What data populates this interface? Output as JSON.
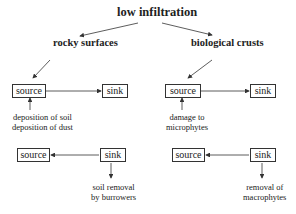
{
  "diagram": {
    "title": "low infiltration",
    "branches": [
      {
        "heading": "rocky surfaces",
        "top_flow": {
          "source": "source",
          "sink": "sink",
          "note_lines": [
            "deposition of soil",
            "deposition of dust"
          ]
        },
        "bottom_flow": {
          "source": "source",
          "sink": "sink",
          "note_lines": [
            "soil removal",
            "by burrowers"
          ]
        }
      },
      {
        "heading": "biological crusts",
        "top_flow": {
          "source": "source",
          "sink": "sink",
          "note_lines": [
            "damage to",
            "microphytes"
          ]
        },
        "bottom_flow": {
          "source": "source",
          "sink": "sink",
          "note_lines": [
            "removal of",
            "macrophytes"
          ]
        }
      }
    ]
  }
}
